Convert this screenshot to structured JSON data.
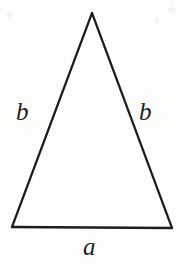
{
  "figure": {
    "kind": "geometry-diagram",
    "shape": "isosceles-triangle",
    "background_color": "#fdfdfc",
    "ink_color": "#1d1d1d",
    "stroke_width": 2.2,
    "vertices": {
      "apex": {
        "x": 92,
        "y": 13
      },
      "bottom_left": {
        "x": 12,
        "y": 227
      },
      "bottom_right": {
        "x": 172,
        "y": 228
      }
    },
    "labels": {
      "left_side": "b",
      "right_side": "b",
      "base": "a"
    }
  }
}
